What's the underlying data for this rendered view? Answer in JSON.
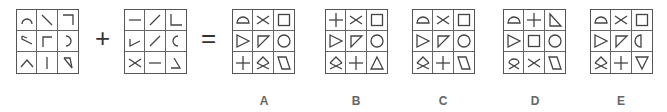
{
  "puzzle": {
    "operators": {
      "plus": "+",
      "equals": "="
    },
    "grid_1": [
      "arc-top",
      "diag-down",
      "corner-top-right",
      "angle-left",
      "corner-top-left",
      "arc-right",
      "caret-up",
      "vertical-line",
      "angle-slash"
    ],
    "grid_2": [
      "horizontal-line",
      "diag-up",
      "corner-bottom-left",
      "check-angle",
      "diag-up",
      "arc-left",
      "x-cross",
      "horizontal-line",
      "angle-bottom-right"
    ],
    "options": [
      {
        "label": "A",
        "cells": [
          "semicircle",
          "x-cross",
          "square",
          "triangle-right",
          "right-triangle",
          "circle",
          "plus",
          "diamond-x",
          "parallelogram"
        ]
      },
      {
        "label": "B",
        "cells": [
          "plus",
          "x-cross",
          "square",
          "triangle-right",
          "right-triangle",
          "circle",
          "diamond-x",
          "plus",
          "triangle-up"
        ]
      },
      {
        "label": "C",
        "cells": [
          "semicircle",
          "x-cross",
          "square",
          "triangle-right",
          "right-triangle",
          "circle",
          "diamond-x",
          "plus",
          "parallelogram"
        ]
      },
      {
        "label": "D",
        "cells": [
          "semicircle",
          "plus",
          "right-triangle-b",
          "triangle-right",
          "square",
          "circle",
          "loop-x",
          "x-cross",
          "parallelogram"
        ]
      },
      {
        "label": "E",
        "cells": [
          "semicircle",
          "x-cross",
          "square",
          "triangle-right",
          "right-triangle",
          "half-circle-right",
          "diamond-x",
          "plus",
          "triangle-down"
        ]
      }
    ]
  }
}
